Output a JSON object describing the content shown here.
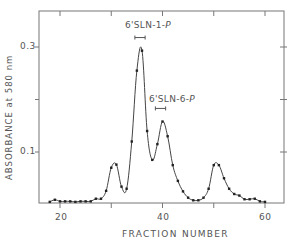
{
  "chart_data": {
    "type": "line",
    "title": "",
    "xlabel": "FRACTION NUMBER",
    "ylabel": "ABSORBANCE at 580 nm",
    "xlim": [
      16,
      64
    ],
    "ylim": [
      0,
      0.39
    ],
    "x_ticks": [
      20,
      30,
      40,
      50,
      60
    ],
    "x_tick_labels": [
      "20",
      "",
      "40",
      "",
      "60"
    ],
    "y_ticks": [
      0.1,
      0.2,
      0.3
    ],
    "y_tick_labels": [
      "0.1",
      "",
      "0.3"
    ],
    "grid": false,
    "legend": null,
    "series": [
      {
        "name": "Absorbance",
        "marker": "dot",
        "x": [
          18,
          19,
          20,
          21,
          22,
          23,
          24,
          25,
          26,
          27,
          28,
          29,
          30,
          31,
          32,
          33,
          34,
          35,
          36,
          37,
          38,
          39,
          40,
          41,
          42,
          43,
          44,
          45,
          46,
          47,
          48,
          49,
          50,
          51,
          52,
          53,
          54,
          55,
          56,
          57,
          58,
          59,
          60
        ],
        "y": [
          0.005,
          0.009,
          0.006,
          0.006,
          0.006,
          0.005,
          0.006,
          0.006,
          0.006,
          0.011,
          0.011,
          0.026,
          0.07,
          0.076,
          0.034,
          0.03,
          0.12,
          0.255,
          0.293,
          0.14,
          0.085,
          0.115,
          0.158,
          0.13,
          0.075,
          0.045,
          0.025,
          0.013,
          0.008,
          0.008,
          0.013,
          0.03,
          0.075,
          0.075,
          0.05,
          0.03,
          0.02,
          0.017,
          0.01,
          0.01,
          0.011,
          0.006,
          0.005
        ]
      }
    ],
    "annotations": [
      {
        "text": "6'SLN-1-P",
        "range": [
          35,
          37
        ],
        "y": 0.318
      },
      {
        "text": "6'SLN-6-P",
        "range": [
          39,
          41
        ],
        "y": 0.183
      }
    ]
  },
  "labels": {
    "xlabel": "FRACTION NUMBER",
    "ylabel": "ABSORBANCE at 580 nm",
    "ytick_03": "0.3",
    "ytick_01": "0.1",
    "xtick_20": "20",
    "xtick_40": "40",
    "xtick_60": "60",
    "ann1": "6'SLN-1-",
    "ann1_italic": "P",
    "ann2": "6'SLN-6-",
    "ann2_italic": "P"
  }
}
